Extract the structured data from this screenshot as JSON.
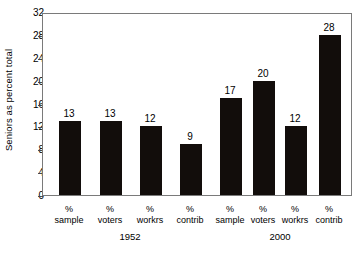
{
  "chart_data": {
    "type": "bar",
    "title": "",
    "xlabel": "",
    "ylabel": "Seniors as percent total",
    "ylim": [
      0,
      32
    ],
    "yticks": [
      0,
      4,
      8,
      12,
      16,
      20,
      24,
      28,
      32
    ],
    "grid": false,
    "legend": "none",
    "bar_color": "#120d0b",
    "groups": [
      {
        "name": "1952",
        "categories": [
          "% sample",
          "% voters",
          "% workrs",
          "% contrib"
        ],
        "values": [
          13,
          13,
          12,
          9
        ]
      },
      {
        "name": "2000",
        "categories": [
          "% sample",
          "% voters",
          "% workrs",
          "% contrib"
        ],
        "values": [
          17,
          20,
          12,
          28
        ]
      }
    ],
    "categories": [
      "% sample",
      "% voters",
      "% workrs",
      "% contrib"
    ],
    "series": [
      {
        "name": "1952",
        "values": [
          13,
          13,
          12,
          9
        ]
      },
      {
        "name": "2000",
        "values": [
          17,
          20,
          12,
          28
        ]
      }
    ]
  },
  "axis": {
    "y_title": "Seniors as percent total",
    "y_ticks": [
      "32",
      "28",
      "24",
      "20",
      "16",
      "12",
      "8",
      "4",
      "0"
    ]
  },
  "bars": [
    {
      "value_label": "13",
      "cat_pct": "%",
      "cat_name": "sample"
    },
    {
      "value_label": "13",
      "cat_pct": "%",
      "cat_name": "voters"
    },
    {
      "value_label": "12",
      "cat_pct": "%",
      "cat_name": "workrs"
    },
    {
      "value_label": "9",
      "cat_pct": "%",
      "cat_name": "contrib"
    },
    {
      "value_label": "17",
      "cat_pct": "%",
      "cat_name": "sample"
    },
    {
      "value_label": "20",
      "cat_pct": "%",
      "cat_name": "voters"
    },
    {
      "value_label": "12",
      "cat_pct": "%",
      "cat_name": "workrs"
    },
    {
      "value_label": "28",
      "cat_pct": "%",
      "cat_name": "contrib"
    }
  ],
  "group_labels": [
    {
      "label": "1952"
    },
    {
      "label": "2000"
    }
  ]
}
